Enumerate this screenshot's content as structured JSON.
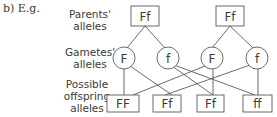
{
  "intro": "b) E.g.",
  "row_labels": {
    "parents": [
      "Parents'",
      "alleles"
    ],
    "gametes": [
      "Gametes'",
      "alleles"
    ],
    "offspring": [
      "Possible",
      "offspring",
      "alleles"
    ]
  },
  "parents": [
    {
      "genotype": "Ff"
    },
    {
      "genotype": "Ff"
    }
  ],
  "gametes": [
    {
      "allele": "F"
    },
    {
      "allele": "f"
    },
    {
      "allele": "F"
    },
    {
      "allele": "f"
    }
  ],
  "offspring": [
    {
      "genotype": "FF"
    },
    {
      "genotype": "Ff"
    },
    {
      "genotype": "Ff"
    },
    {
      "genotype": "ff"
    }
  ],
  "colors": {
    "line": "#5a5a5a",
    "text": "#3a3a3a",
    "background": "#ffffff"
  }
}
